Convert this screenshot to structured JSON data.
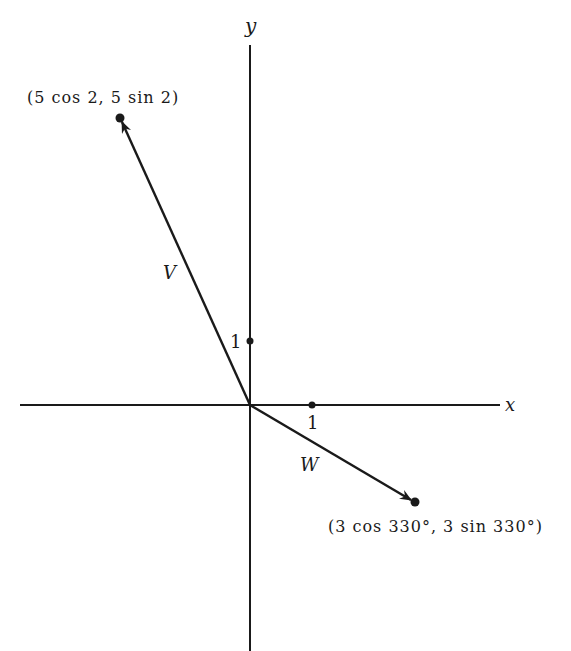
{
  "diagram": {
    "type": "vector-plane",
    "axes": {
      "x_label": "x",
      "y_label": "y"
    },
    "ticks": {
      "x_tick_label": "1",
      "y_tick_label": "1"
    },
    "vectors": [
      {
        "name": "V",
        "endpoint_label": "(5 cos 2, 5 sin 2)",
        "magnitude": 5,
        "angle": "2 rad"
      },
      {
        "name": "W",
        "endpoint_label": "(3 cos 330°, 3 sin 330°)",
        "magnitude": 3,
        "angle": "330°"
      }
    ],
    "colors": {
      "stroke": "#1a1a1a",
      "background": "#ffffff"
    }
  }
}
